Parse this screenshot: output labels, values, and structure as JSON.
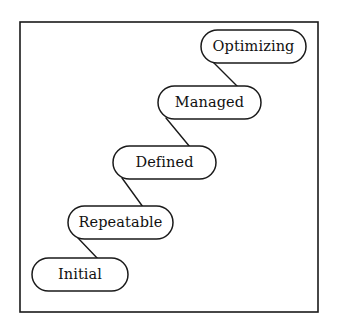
{
  "diagram": {
    "type": "staircase-flow",
    "background_color": "#ffffff",
    "stroke_color": "#1a1a1a",
    "fill_color": "#ffffff",
    "frame": {
      "name": "outer-border",
      "x": 20,
      "y": 22,
      "width": 298,
      "height": 290
    },
    "stages": [
      {
        "id": "initial",
        "label": "Initial",
        "level": 1,
        "x": 32,
        "y": 258,
        "width": 96,
        "height": 33
      },
      {
        "id": "repeatable",
        "label": "Repeatable",
        "level": 2,
        "x": 68,
        "y": 206,
        "width": 105,
        "height": 33
      },
      {
        "id": "defined",
        "label": "Defined",
        "level": 3,
        "x": 113,
        "y": 146,
        "width": 103,
        "height": 33
      },
      {
        "id": "managed",
        "label": "Managed",
        "level": 4,
        "x": 158,
        "y": 86,
        "width": 103,
        "height": 33
      },
      {
        "id": "optimizing",
        "label": "Optimizing",
        "level": 5,
        "x": 201,
        "y": 30,
        "width": 105,
        "height": 33
      }
    ],
    "connectors": [
      {
        "id": "initial-to-repeatable",
        "from": "initial",
        "to": "repeatable",
        "x1": 98,
        "y1": 259,
        "x2": 78,
        "y2": 238
      },
      {
        "id": "repeatable-to-defined",
        "from": "repeatable",
        "to": "defined",
        "x1": 143,
        "y1": 207,
        "x2": 122,
        "y2": 178
      },
      {
        "id": "defined-to-managed",
        "from": "defined",
        "to": "managed",
        "x1": 190,
        "y1": 147,
        "x2": 166,
        "y2": 118
      },
      {
        "id": "managed-to-optimizing",
        "from": "managed",
        "to": "optimizing",
        "x1": 238,
        "y1": 87,
        "x2": 213,
        "y2": 62
      }
    ]
  }
}
